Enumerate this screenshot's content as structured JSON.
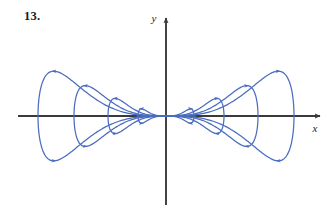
{
  "figure": {
    "problem_number": "13.",
    "caption": "",
    "background_color": "#ffffff"
  },
  "axes": {
    "x_label": "x",
    "y_label": "y",
    "axis_color": "#3a3a3a",
    "origin_px": [
      166,
      116
    ],
    "x_axis": {
      "start_px": 18,
      "end_px": 322,
      "y_px": 116,
      "arrow": "right"
    },
    "y_axis": {
      "start_px": 205,
      "end_px": 16,
      "x_px": 166,
      "arrow": "up"
    }
  },
  "chart_data": {
    "type": "line",
    "title": "",
    "subtitle": "",
    "xlabel": "x",
    "ylabel": "y",
    "grid": false,
    "legend": null,
    "curve_color": "#4a6cc0",
    "xlim": [
      -2.2,
      2.2
    ],
    "ylim": [
      -1.0,
      1.0
    ],
    "saddle_point": [
      0,
      0
    ],
    "centers": [
      [
        -1.0,
        0
      ],
      [
        1.0,
        0
      ]
    ],
    "levels": [
      0.07,
      0.28,
      0.58,
      0.92
    ],
    "series": [
      {
        "name": "orbit-level-1",
        "level": 0.07,
        "lobe_half_width_px": 28,
        "lobe_half_height_px": 9,
        "arrow_count": 4
      },
      {
        "name": "orbit-level-2",
        "level": 0.28,
        "lobe_half_width_px": 58,
        "lobe_half_height_px": 22,
        "arrow_count": 4
      },
      {
        "name": "orbit-level-3",
        "level": 0.58,
        "lobe_half_width_px": 92,
        "lobe_half_height_px": 38,
        "arrow_count": 4
      },
      {
        "name": "orbit-level-4",
        "level": 0.92,
        "lobe_half_width_px": 128,
        "lobe_half_height_px": 56,
        "arrow_count": 4
      }
    ],
    "flow_direction": {
      "upper_left_lobe": "rightward-toward-origin",
      "lower_left_lobe": "rightward-away-from-origin",
      "upper_right_lobe": "leftward-toward-origin",
      "lower_right_lobe": "leftward-away-from-origin"
    }
  }
}
